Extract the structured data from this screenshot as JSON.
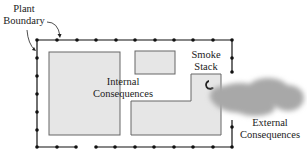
{
  "diagram": {
    "labels": {
      "plant_boundary_line1": "Plant",
      "plant_boundary_line2": "Boundary",
      "internal_line1": "Internal",
      "internal_line2": "Consequences",
      "smoke_line1": "Smoke",
      "smoke_line2": "Stack",
      "external_line1": "External",
      "external_line2": "Consequences"
    },
    "colors": {
      "building_fill": "#e6e6e6",
      "building_stroke": "#555555",
      "boundary": "#111111",
      "smoke": "#a8a8a8"
    }
  }
}
